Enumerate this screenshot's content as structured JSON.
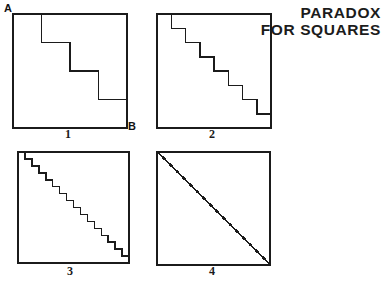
{
  "canvas": {
    "width": 387,
    "height": 283,
    "background_color": "#ffffff",
    "ink_color": "#1b1b1b"
  },
  "title": {
    "line1": "PARADOX",
    "line2": "FOR SQUARES",
    "align": "right"
  },
  "vertex_labels": {
    "a": "A",
    "b": "B"
  },
  "panels": [
    {
      "id": "panel-1",
      "caption": "1",
      "steps": 4,
      "square": {
        "x": 13,
        "y": 14,
        "size": 114
      },
      "caption_pos": {
        "x": 68,
        "y": 127
      },
      "description": "square with 4-step staircase from A to B"
    },
    {
      "id": "panel-2",
      "caption": "2",
      "steps": 8,
      "square": {
        "x": 157,
        "y": 14,
        "size": 114
      },
      "caption_pos": {
        "x": 212,
        "y": 127
      },
      "description": "square with 8-step staircase"
    },
    {
      "id": "panel-3",
      "caption": "3",
      "steps": 16,
      "square": {
        "x": 18,
        "y": 152,
        "size": 111
      },
      "caption_pos": {
        "x": 70,
        "y": 264
      },
      "description": "square with 16-step staircase"
    },
    {
      "id": "panel-4",
      "caption": "4",
      "steps": 96,
      "square": {
        "x": 157,
        "y": 152,
        "size": 113
      },
      "caption_pos": {
        "x": 212,
        "y": 264
      },
      "description": "square with limiting staircase appearing as a straight diagonal"
    }
  ],
  "chart_data": {
    "type": "diagram",
    "title": "PARADOX FOR SQUARES",
    "subtitle": "",
    "xlabel": "",
    "ylabel": "",
    "series": [
      {
        "name": "Panel 1",
        "label": "1",
        "steps": 4,
        "staircase_length": 2,
        "diagonal_length": 1.414
      },
      {
        "name": "Panel 2",
        "label": "2",
        "steps": 8,
        "staircase_length": 2,
        "diagonal_length": 1.414
      },
      {
        "name": "Panel 3",
        "label": "3",
        "steps": 16,
        "staircase_length": 2,
        "diagonal_length": 1.414
      },
      {
        "name": "Panel 4",
        "label": "4",
        "steps": 96,
        "staircase_length": 2,
        "diagonal_length": 1.414
      }
    ],
    "categories": [
      "1",
      "2",
      "3",
      "4"
    ],
    "values": [
      4,
      8,
      16,
      96
    ],
    "annotations": [
      "A",
      "B"
    ],
    "legend_position": "none",
    "grid": false
  }
}
